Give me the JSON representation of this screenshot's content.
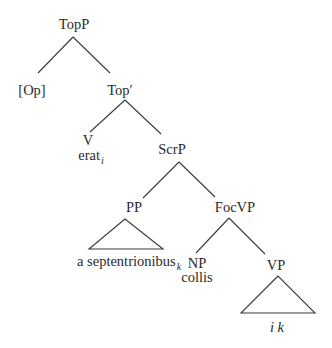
{
  "diagram": {
    "type": "syntax-tree",
    "nodes": {
      "topp": {
        "label": "TopP"
      },
      "op": {
        "label": "[Op]"
      },
      "topbar": {
        "label": "Top′"
      },
      "v": {
        "label": "V",
        "word": "erat",
        "index": "i"
      },
      "scrp": {
        "label": "ScrP"
      },
      "pp": {
        "label": "PP",
        "word": "a septentrionibus",
        "index": "k"
      },
      "focvp": {
        "label": "FocVP"
      },
      "np": {
        "label": "NP",
        "word": "collis"
      },
      "vp": {
        "label": "VP",
        "trace": "i k"
      }
    },
    "edges": [
      [
        "TopP",
        "[Op]"
      ],
      [
        "TopP",
        "Top′"
      ],
      [
        "Top′",
        "V"
      ],
      [
        "Top′",
        "ScrP"
      ],
      [
        "ScrP",
        "PP"
      ],
      [
        "ScrP",
        "FocVP"
      ],
      [
        "FocVP",
        "NP"
      ],
      [
        "FocVP",
        "VP"
      ]
    ],
    "triangles": [
      "PP",
      "VP"
    ]
  }
}
